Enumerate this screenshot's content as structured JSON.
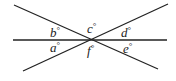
{
  "diagram": {
    "type": "intersecting-lines",
    "lines": [
      {
        "name": "horizontal-line",
        "x1": 13,
        "y1": 40,
        "x2": 167,
        "y2": 40
      },
      {
        "name": "descending-line",
        "x1": 14,
        "y1": 5,
        "x2": 158,
        "y2": 69
      },
      {
        "name": "ascending-line",
        "x1": 23,
        "y1": 71,
        "x2": 168,
        "y2": 4
      }
    ],
    "intersection": {
      "x": 93,
      "y": 40
    },
    "angles": [
      {
        "letter": "a",
        "degree": "°",
        "x": 50,
        "y": 52
      },
      {
        "letter": "b",
        "degree": "°",
        "x": 50,
        "y": 37
      },
      {
        "letter": "c",
        "degree": "°",
        "x": 87,
        "y": 33
      },
      {
        "letter": "d",
        "degree": "°",
        "x": 121,
        "y": 37
      },
      {
        "letter": "e",
        "degree": "°",
        "x": 123,
        "y": 53
      },
      {
        "letter": "f",
        "degree": "°",
        "x": 87,
        "y": 55
      }
    ],
    "stroke_color": "#222222"
  }
}
